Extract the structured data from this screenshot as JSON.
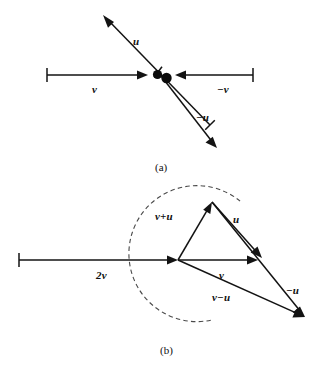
{
  "figure": {
    "type": "vector-diagram",
    "width": 326,
    "height": 368,
    "background_color": "#ffffff",
    "ink_color": "#131313",
    "dashed_color": "#4a4a4a"
  },
  "panel_a": {
    "caption": "(a)",
    "description": "Two point masses at a common origin with vectors u, -u, v and -v radiating outward",
    "labels": {
      "u": "u",
      "minus_u": "−u",
      "v": "v",
      "minus_v": "−v"
    },
    "vectors": [
      {
        "name": "u",
        "label": "u",
        "from": [
          210,
          125
        ],
        "to": [
          103,
          15
        ],
        "label_pos": [
          133,
          36
        ],
        "tail_tick": false
      },
      {
        "name": "minus-u",
        "label": "−u",
        "from": [
          158,
          72
        ],
        "to": [
          217,
          148
        ],
        "label_pos": [
          196,
          112
        ],
        "tail_tick": false
      },
      {
        "name": "v",
        "label": "v",
        "from": [
          47,
          75
        ],
        "to": [
          148,
          75
        ],
        "label_pos": [
          92,
          84
        ],
        "tail_tick": true
      },
      {
        "name": "minus-v",
        "label": "−v",
        "from": [
          253,
          75
        ],
        "to": [
          175,
          75
        ],
        "label_pos": [
          217,
          84
        ],
        "tail_tick": true
      }
    ],
    "dots": [
      {
        "name": "particle-1",
        "cx": 157.5,
        "cy": 74.5,
        "r": 4.6
      },
      {
        "name": "particle-2",
        "cx": 166.5,
        "cy": 78.0,
        "r": 5.2
      }
    ]
  },
  "panel_b": {
    "caption": "(b)",
    "description": "Vector addition and subtraction triangle: 2v along the axis, then v, v+u, u, -u and v-u forming a closed figure with a dashed arc of constant radius",
    "labels": {
      "two_v": "2v",
      "v": "v",
      "v_plus_u": "v+u",
      "u": "u",
      "minus_u": "−u",
      "v_minus_u": "v−u"
    },
    "origin": [
      178,
      260
    ],
    "apex": [
      212,
      202
    ],
    "v_tip": [
      258,
      260
    ],
    "lower_tip": [
      305,
      317
    ],
    "arc": {
      "center": [
        178,
        260
      ],
      "radius": 68,
      "start_angle_deg": -60,
      "end_angle_deg": 24
    },
    "vectors": [
      {
        "name": "two-v",
        "label": "2v",
        "from": [
          19,
          260
        ],
        "to": [
          178,
          260
        ],
        "label_pos": [
          96,
          270
        ],
        "tail_tick": true
      },
      {
        "name": "v",
        "label": "v",
        "from": [
          178,
          260
        ],
        "to": [
          258,
          260
        ],
        "label_pos": [
          219,
          270
        ],
        "tail_tick": false
      },
      {
        "name": "v-plus-u",
        "label": "v+u",
        "from": [
          178,
          260
        ],
        "to": [
          212,
          202
        ],
        "label_pos": [
          158,
          211
        ],
        "tail_tick": false
      },
      {
        "name": "u",
        "label": "u",
        "from": [
          212,
          202
        ],
        "to": [
          262,
          258
        ],
        "label_pos": [
          233,
          214
        ],
        "tail_tick": false
      },
      {
        "name": "minus-u",
        "label": "−u",
        "from": [
          212,
          202
        ],
        "to": [
          305,
          317
        ],
        "label_pos": [
          286,
          285
        ],
        "tail_tick": false
      },
      {
        "name": "v-minus-u",
        "label": "v−u",
        "from": [
          178,
          260
        ],
        "to": [
          305,
          317
        ],
        "label_pos": [
          214,
          292
        ],
        "tail_tick": false
      }
    ]
  }
}
